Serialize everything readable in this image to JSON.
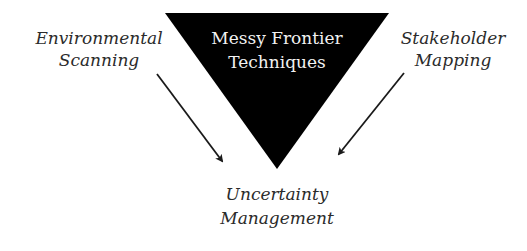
{
  "diagram": {
    "center": {
      "shape": "inverted-triangle",
      "fill": "#000000",
      "text_color": "#f2f2f2",
      "lines": [
        "Messy Frontier",
        "Techniques"
      ]
    },
    "left_input": {
      "lines": [
        "Environmental",
        "Scanning"
      ]
    },
    "right_input": {
      "lines": [
        "Stakeholder",
        "Mapping"
      ]
    },
    "output": {
      "lines": [
        "Uncertainty",
        "Management"
      ]
    },
    "edges": [
      {
        "from": "Environmental Scanning",
        "to": "Uncertainty Management"
      },
      {
        "from": "Stakeholder Mapping",
        "to": "Uncertainty Management"
      }
    ],
    "colors": {
      "label_text": "#2b2b2b",
      "arrow": "#1a1a1a",
      "background": "#ffffff"
    }
  }
}
